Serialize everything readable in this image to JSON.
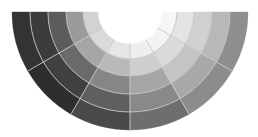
{
  "diagram": {
    "type": "half-color-wheel",
    "background": "#ffffff",
    "center": [
      130,
      12
    ],
    "radii": [
      32,
      47,
      64,
      82,
      100,
      118
    ],
    "separator_color": "#c8c8c8",
    "separator_width": 0.9,
    "sectors": [
      {
        "start_deg": 180,
        "end_deg": 150,
        "ring_colors": [
          "#d2d2d2",
          "#9a9a9a",
          "#5c5c5c",
          "#3c3c3c",
          "#333333"
        ]
      },
      {
        "start_deg": 150,
        "end_deg": 120,
        "ring_colors": [
          "#dadada",
          "#a6a6a6",
          "#6a6a6a",
          "#404040",
          "#2e2e2e"
        ]
      },
      {
        "start_deg": 120,
        "end_deg": 90,
        "ring_colors": [
          "#e6e6e6",
          "#b9b9b9",
          "#868686",
          "#5f5f5f",
          "#4a4a4a"
        ]
      },
      {
        "start_deg": 90,
        "end_deg": 60,
        "ring_colors": [
          "#eeeeee",
          "#cfcfcf",
          "#a6a6a6",
          "#898989",
          "#6e6e6e"
        ]
      },
      {
        "start_deg": 60,
        "end_deg": 30,
        "ring_colors": [
          "#f3f3f3",
          "#dbdbdb",
          "#c4c4c4",
          "#a9a9a9",
          "#8c8c8c"
        ]
      },
      {
        "start_deg": 30,
        "end_deg": 0,
        "ring_colors": [
          "#f6f6f6",
          "#e4e4e4",
          "#d0d0d0",
          "#b8b8b8",
          "#8e8e8e"
        ]
      }
    ]
  }
}
